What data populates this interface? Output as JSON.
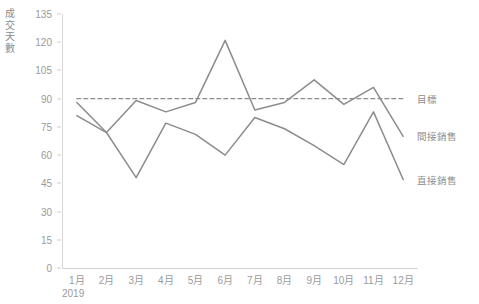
{
  "chart_data": {
    "type": "line",
    "title": "",
    "xlabel": "2019",
    "ylabel": "成交天數",
    "categories": [
      "1月",
      "2月",
      "3月",
      "4月",
      "5月",
      "6月",
      "7月",
      "8月",
      "9月",
      "10月",
      "11月",
      "12月"
    ],
    "ylim": [
      0,
      135
    ],
    "yticks": [
      0,
      15,
      30,
      45,
      60,
      75,
      90,
      105,
      120,
      135
    ],
    "grid": false,
    "legend_position": "right",
    "series": [
      {
        "name": "間接銷售",
        "color": "#8c8c8c",
        "style": "solid",
        "values": [
          88,
          72,
          89,
          83,
          88,
          121,
          84,
          88,
          100,
          87,
          96,
          70
        ]
      },
      {
        "name": "直接銷售",
        "color": "#8c8c8c",
        "style": "solid",
        "values": [
          81,
          72,
          48,
          77,
          71,
          60,
          80,
          74,
          65,
          55,
          83,
          47
        ]
      },
      {
        "name": "目標",
        "color": "#8c8c8c",
        "style": "dashed",
        "values": [
          90,
          90,
          90,
          90,
          90,
          90,
          90,
          90,
          90,
          90,
          90,
          90
        ]
      }
    ]
  },
  "axis": {
    "y_title": "成交天數",
    "x_group": "2019"
  },
  "legend": {
    "target_label": "目標",
    "indirect_label": "間接銷售",
    "direct_label": "直接銷售"
  }
}
